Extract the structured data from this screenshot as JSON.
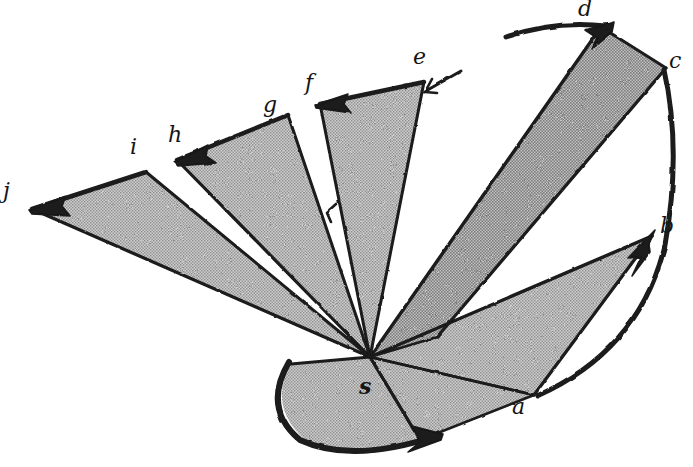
{
  "figure": {
    "kind": "hand-drawn-fan-wedge-diagram",
    "background_color": "#ffffff",
    "ink_color": "#1a1a1a",
    "wedge_fill_color": "#b9b9b9",
    "wedge_fill_hatch_color": "#8d8d8d",
    "canvas": {
      "width": 693,
      "height": 467
    },
    "apex": {
      "label": "s",
      "x": 370,
      "y": 357
    }
  },
  "labels": [
    {
      "id": "label-s",
      "text": "s",
      "x": 359,
      "y": 375,
      "bold": true
    },
    {
      "id": "label-a",
      "text": "a",
      "x": 512,
      "y": 396,
      "bold": false
    },
    {
      "id": "label-b",
      "text": "b",
      "x": 660,
      "y": 215,
      "bold": false
    },
    {
      "id": "label-c",
      "text": "c",
      "x": 669,
      "y": 50,
      "bold": false
    },
    {
      "id": "label-d",
      "text": "d",
      "x": 578,
      "y": -2,
      "bold": false
    },
    {
      "id": "label-e",
      "text": "e",
      "x": 413,
      "y": 46,
      "bold": false
    },
    {
      "id": "label-f",
      "text": "f",
      "x": 305,
      "y": 72,
      "bold": false
    },
    {
      "id": "label-g",
      "text": "g",
      "x": 263,
      "y": 94,
      "bold": false
    },
    {
      "id": "label-h",
      "text": "h",
      "x": 168,
      "y": 124,
      "bold": false
    },
    {
      "id": "label-i",
      "text": "i",
      "x": 130,
      "y": 136,
      "bold": false
    },
    {
      "id": "label-j",
      "text": "j",
      "x": 3,
      "y": 180,
      "bold": false
    }
  ],
  "wedges": [
    {
      "id": "wedge-sa",
      "name": "wedge-s-a",
      "from": "s",
      "to": "a",
      "filled": true
    },
    {
      "id": "wedge-ab",
      "name": "wedge-a-b",
      "from": "a",
      "to": "b",
      "filled": true
    },
    {
      "id": "wedge-cd",
      "name": "wedge-c-d",
      "from": "c",
      "to": "d",
      "filled": true
    },
    {
      "id": "wedge-ef",
      "name": "wedge-e-f",
      "from": "e",
      "to": "f",
      "filled": true
    },
    {
      "id": "wedge-gh",
      "name": "wedge-g-h",
      "from": "g",
      "to": "h",
      "filled": true
    },
    {
      "id": "wedge-ij",
      "name": "wedge-i-j",
      "from": "i",
      "to": "j",
      "filled": true
    },
    {
      "id": "wedge-bot",
      "name": "wedge-bottom-left",
      "from": "s",
      "to": "arc-start",
      "filled": true
    }
  ],
  "arrows": [
    {
      "id": "arrow-to-a",
      "name": "arrow-arc-to-a",
      "direction": "clockwise-along-bottom-arc"
    },
    {
      "id": "arrow-to-b",
      "name": "arrow-to-b",
      "direction": "up-right"
    },
    {
      "id": "arrow-to-d",
      "name": "arrow-arc-to-d",
      "direction": "up-right"
    },
    {
      "id": "arrow-to-f",
      "name": "arrow-to-f",
      "direction": "left"
    },
    {
      "id": "arrow-to-h",
      "name": "arrow-to-h",
      "direction": "down-left"
    },
    {
      "id": "arrow-to-j",
      "name": "arrow-to-j",
      "direction": "left"
    },
    {
      "id": "tick-at-e",
      "name": "tick-mark-at-e",
      "direction": "down-left"
    },
    {
      "id": "tick-mid",
      "name": "tick-mark-between-g-and-f",
      "direction": "down-left"
    }
  ]
}
